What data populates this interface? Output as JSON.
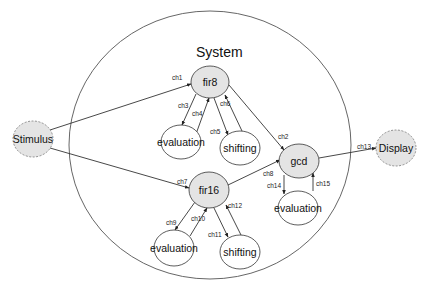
{
  "diagram": {
    "title": "System",
    "container": {
      "cx": 210,
      "cy": 145,
      "rx": 141,
      "ry": 134,
      "stroke": "#555555"
    },
    "colors": {
      "process_fill": "#e4e4e4",
      "external_fill": "#e4e4e4",
      "plain_fill": "#ffffff",
      "stroke": "#333333"
    },
    "nodes": [
      {
        "id": "stimulus",
        "label": "Stimulus",
        "cx": 33,
        "cy": 139,
        "rx": 20,
        "ry": 18,
        "style": "external"
      },
      {
        "id": "fir8",
        "label": "fir8",
        "cx": 210,
        "cy": 82,
        "rx": 19,
        "ry": 16,
        "style": "process"
      },
      {
        "id": "eval1",
        "label": "evaluation",
        "cx": 181,
        "cy": 142,
        "rx": 20,
        "ry": 17,
        "style": "plain"
      },
      {
        "id": "shift1",
        "label": "shifting",
        "cx": 240,
        "cy": 148,
        "rx": 20,
        "ry": 17,
        "style": "plain"
      },
      {
        "id": "gcd",
        "label": "gcd",
        "cx": 299,
        "cy": 161,
        "rx": 20,
        "ry": 17,
        "style": "process"
      },
      {
        "id": "eval3",
        "label": "evaluation",
        "cx": 298,
        "cy": 208,
        "rx": 20,
        "ry": 17,
        "style": "plain"
      },
      {
        "id": "display",
        "label": "Display",
        "cx": 396,
        "cy": 148,
        "rx": 20,
        "ry": 18,
        "style": "external"
      },
      {
        "id": "fir16",
        "label": "fir16",
        "cx": 209,
        "cy": 190,
        "rx": 20,
        "ry": 18,
        "style": "process"
      },
      {
        "id": "eval2",
        "label": "evaluation",
        "cx": 174,
        "cy": 248,
        "rx": 20,
        "ry": 18,
        "style": "plain"
      },
      {
        "id": "shift2",
        "label": "shifting",
        "cx": 240,
        "cy": 252,
        "rx": 20,
        "ry": 17,
        "style": "plain"
      }
    ],
    "edges": [
      {
        "label": "ch1",
        "x1": 50,
        "y1": 130,
        "x2": 191,
        "y2": 84,
        "lx": 172,
        "ly": 80
      },
      {
        "label": "ch7",
        "x1": 50,
        "y1": 148,
        "x2": 189,
        "y2": 188,
        "lx": 177,
        "ly": 184
      },
      {
        "label": "ch2",
        "x1": 229,
        "y1": 85,
        "x2": 284,
        "y2": 150,
        "lx": 278,
        "ly": 139
      },
      {
        "label": "ch8",
        "x1": 228,
        "y1": 185,
        "x2": 280,
        "y2": 160,
        "lx": 263,
        "ly": 176
      },
      {
        "label": "ch3",
        "x1": 196,
        "y1": 94,
        "x2": 182,
        "y2": 125,
        "lx": 178,
        "ly": 108
      },
      {
        "label": "ch4",
        "x1": 196,
        "y1": 134,
        "x2": 209,
        "y2": 98,
        "lx": 192,
        "ly": 116
      },
      {
        "label": "ch5",
        "x1": 214,
        "y1": 98,
        "x2": 228,
        "y2": 135,
        "lx": 210,
        "ly": 134
      },
      {
        "label": "ch6",
        "x1": 242,
        "y1": 131,
        "x2": 225,
        "y2": 95,
        "lx": 220,
        "ly": 106
      },
      {
        "label": "ch9",
        "x1": 195,
        "y1": 202,
        "x2": 175,
        "y2": 230,
        "lx": 166,
        "ly": 225
      },
      {
        "label": "ch10",
        "x1": 190,
        "y1": 236,
        "x2": 207,
        "y2": 208,
        "lx": 191,
        "ly": 221
      },
      {
        "label": "ch11",
        "x1": 214,
        "y1": 208,
        "x2": 228,
        "y2": 237,
        "lx": 208,
        "ly": 237
      },
      {
        "label": "ch12",
        "x1": 241,
        "y1": 235,
        "x2": 226,
        "y2": 205,
        "lx": 228,
        "ly": 208
      },
      {
        "label": "ch13",
        "x1": 319,
        "y1": 158,
        "x2": 376,
        "y2": 148,
        "lx": 357,
        "ly": 149
      },
      {
        "label": "ch14",
        "x1": 284,
        "y1": 175,
        "x2": 284,
        "y2": 194,
        "lx": 267,
        "ly": 188
      },
      {
        "label": "ch15",
        "x1": 313,
        "y1": 191,
        "x2": 313,
        "y2": 173,
        "lx": 316,
        "ly": 186
      }
    ]
  }
}
